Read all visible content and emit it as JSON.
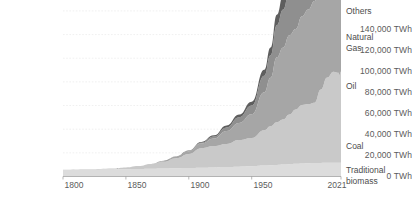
{
  "chart_data": {
    "type": "area",
    "title": "",
    "subtitle": "",
    "xlabel": "",
    "ylabel": "",
    "stacked": true,
    "grid": true,
    "legend_position": "right-inline",
    "xlim": [
      1800,
      2021
    ],
    "ylim": [
      0,
      145000
    ],
    "y_tick_values": [
      0,
      20000,
      40000,
      60000,
      80000,
      100000,
      120000,
      140000
    ],
    "y_tick_labels": [
      "0 TWh",
      "20,000 TWh",
      "40,000 TWh",
      "60,000 TWh",
      "80,000 TWh",
      "100,000 TWh",
      "120,000 TWh",
      "140,000 TWh"
    ],
    "x_tick_values": [
      1800,
      1850,
      1900,
      1950,
      2021
    ],
    "x_tick_labels": [
      "1800",
      "1850",
      "1900",
      "1950",
      "2021"
    ],
    "x": [
      1800,
      1820,
      1840,
      1850,
      1860,
      1870,
      1880,
      1890,
      1900,
      1910,
      1920,
      1930,
      1940,
      1950,
      1960,
      1965,
      1970,
      1975,
      1980,
      1985,
      1990,
      1995,
      2000,
      2005,
      2010,
      2015,
      2019,
      2020,
      2021
    ],
    "series": [
      {
        "name": "Traditional biomass",
        "color": "#dcdcdc",
        "label": "Traditional\nbiomass",
        "values": [
          5600,
          5800,
          6000,
          6100,
          6300,
          6500,
          6700,
          6900,
          7100,
          7400,
          7700,
          8000,
          8300,
          8600,
          9200,
          9500,
          9800,
          10100,
          10400,
          10700,
          11000,
          11200,
          11400,
          11500,
          11600,
          11650,
          11700,
          11700,
          11700
        ]
      },
      {
        "name": "Coal",
        "color": "#c9c9c9",
        "label": "Coal",
        "values": [
          100,
          300,
          800,
          1500,
          2400,
          3800,
          5800,
          8600,
          12000,
          16500,
          18000,
          19500,
          22500,
          24000,
          30000,
          33000,
          36000,
          38000,
          42000,
          46000,
          49500,
          50000,
          51000,
          62000,
          72000,
          77000,
          76000,
          74000,
          77000
        ]
      },
      {
        "name": "Oil",
        "color": "#a6a6a6",
        "label": "Oil",
        "values": [
          0,
          0,
          0,
          0,
          100,
          300,
          700,
          1400,
          2200,
          4000,
          6500,
          11000,
          14500,
          20000,
          32000,
          41000,
          55000,
          61000,
          67000,
          68000,
          75000,
          80000,
          86000,
          93000,
          97000,
          103000,
          108000,
          99000,
          105000
        ]
      },
      {
        "name": "Natural Gas",
        "color": "#8f8f8f",
        "label": "Natural\nGas",
        "values": [
          0,
          0,
          0,
          0,
          0,
          0,
          50,
          150,
          350,
          700,
          1600,
          3000,
          4800,
          7500,
          14000,
          19000,
          27000,
          32000,
          38000,
          42000,
          48000,
          52000,
          58000,
          64000,
          70000,
          74000,
          82000,
          81000,
          85000
        ]
      },
      {
        "name": "Others",
        "color": "#5e5e5e",
        "label": "Others",
        "values": [
          0,
          0,
          0,
          0,
          0,
          0,
          0,
          100,
          300,
          600,
          1000,
          1700,
          2300,
          3200,
          5000,
          6500,
          9000,
          12000,
          16000,
          21000,
          25000,
          28000,
          31000,
          34000,
          38000,
          43000,
          49000,
          49000,
          52000
        ]
      }
    ],
    "total_2021": 145000
  }
}
